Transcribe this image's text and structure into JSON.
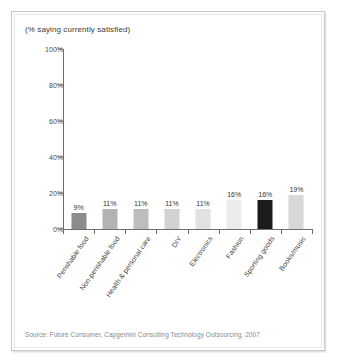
{
  "chart_data": {
    "type": "bar",
    "title": "(% saying currently satisfied)",
    "xlabel": "",
    "ylabel": "",
    "ylim": [
      0,
      100
    ],
    "y_ticks": [
      "0%",
      "20%",
      "40%",
      "60%",
      "80%",
      "100%"
    ],
    "y_tick_values": [
      0,
      20,
      40,
      60,
      80,
      100
    ],
    "grid": false,
    "legend": "none",
    "categories": [
      "Perishable food",
      "Non-perishable food",
      "Health & personal care",
      "DIY",
      "Electronics",
      "Fashion",
      "Sporting goods",
      "Books/music"
    ],
    "values": [
      9,
      11,
      11,
      11,
      11,
      16,
      16,
      19
    ],
    "data_labels": [
      "9%",
      "11%",
      "11%",
      "11%",
      "11%",
      "16%",
      "16%",
      "19%"
    ],
    "bar_colors": [
      "#8c8c8c",
      "#b3b3b3",
      "#bdbdbd",
      "#d2d2d2",
      "#e2e2e2",
      "#ececec",
      "#1c1c1c",
      "#d8d8d8"
    ]
  },
  "source": {
    "text": "Source: Future Consumer, Capgemini Consulting Technology Outsourcing, 2007"
  },
  "colors": {
    "axis": "#6e6e6e",
    "frame": "#c9c9c9",
    "text": "#3a3a3a",
    "source_text": "#8a8a8a"
  }
}
